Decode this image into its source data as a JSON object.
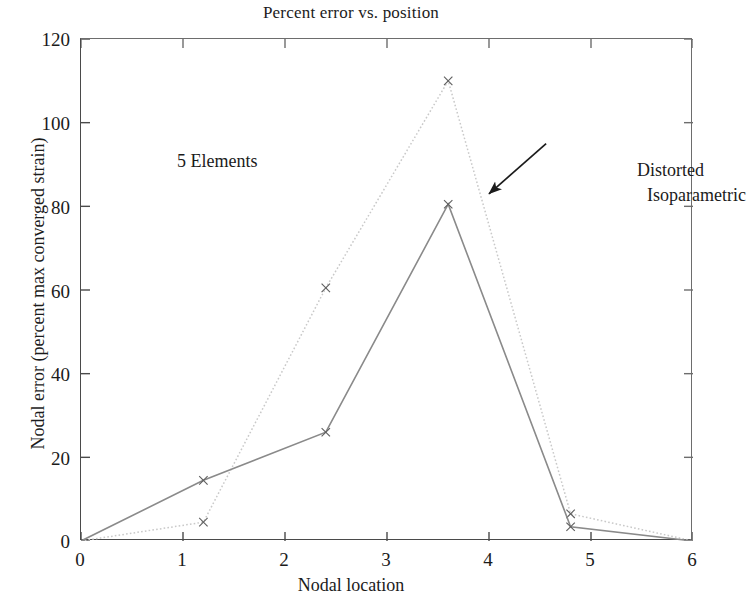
{
  "chart_data": {
    "type": "line",
    "title": "Percent error vs. position",
    "xlabel": "Nodal location",
    "ylabel": "Nodal error (percent max converged strain)",
    "xlim": [
      0,
      6
    ],
    "ylim": [
      0,
      120
    ],
    "xticks": [
      0,
      1,
      2,
      3,
      4,
      5,
      6
    ],
    "yticks": [
      0,
      20,
      40,
      60,
      80,
      100,
      120
    ],
    "grid": false,
    "legend": "none",
    "series": [
      {
        "name": "Distorted Isoparametric",
        "style": "dotted",
        "color": "#c9c9c9",
        "marker": "x",
        "x": [
          0,
          1.2,
          2.4,
          3.6,
          4.8,
          6
        ],
        "y": [
          0,
          4.5,
          60.5,
          110,
          6.5,
          0
        ]
      },
      {
        "name": "Reference",
        "style": "solid",
        "color": "#8a8a8a",
        "marker": "x",
        "x": [
          0,
          1.2,
          2.4,
          3.6,
          4.8,
          6
        ],
        "y": [
          0,
          14.5,
          26,
          80.5,
          3.4,
          0
        ]
      }
    ],
    "annotations": [
      {
        "name": "elements-note",
        "text": "5 Elements",
        "x": 0.16,
        "y": 99
      },
      {
        "name": "series-callout",
        "text_line_1": "Distorted",
        "text_line_2": "Isoparametric",
        "arrow_from": [
          4.56,
          95
        ],
        "arrow_to": [
          4.0,
          83
        ]
      }
    ]
  },
  "labels": {
    "title": "Percent error vs. position",
    "xaxis_title": "Nodal location",
    "yaxis_title": "Nodal error (percent max converged strain)",
    "elements_note": "5 Elements",
    "callout_line_1": "Distorted",
    "callout_line_2": "Isoparametric",
    "yticks": [
      "0",
      "20",
      "40",
      "60",
      "80",
      "100",
      "120"
    ],
    "xticks": [
      "0",
      "1",
      "2",
      "3",
      "4",
      "5",
      "6"
    ]
  }
}
